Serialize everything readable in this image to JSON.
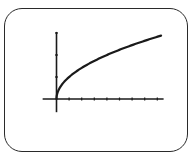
{
  "chart_data": {
    "type": "line",
    "title": "",
    "xlabel": "",
    "ylabel": "",
    "function": "y = sqrt(x)",
    "series": [
      {
        "name": "y = sqrt(x)",
        "x": [
          0,
          0.05,
          0.25,
          0.5,
          1,
          2,
          3,
          4,
          5,
          6,
          7,
          8,
          8.3
        ],
        "values": [
          0,
          0.224,
          0.5,
          0.707,
          1,
          1.414,
          1.732,
          2,
          2.236,
          2.449,
          2.646,
          2.828,
          2.881
        ]
      }
    ],
    "xlim": [
      -1.1,
      8.5
    ],
    "ylim": [
      -0.6,
      3.05
    ],
    "x_ticks": [
      1,
      2,
      3,
      4,
      5,
      6,
      7,
      8
    ],
    "y_ticks": [
      1,
      2,
      3
    ],
    "tick_labels_shown": false,
    "grid": false,
    "legend": "none",
    "colors": {
      "curve": "#1a1a1a",
      "axes": "#1a1a1a",
      "frame": "#2a2a2a",
      "background": "#ffffff"
    }
  }
}
